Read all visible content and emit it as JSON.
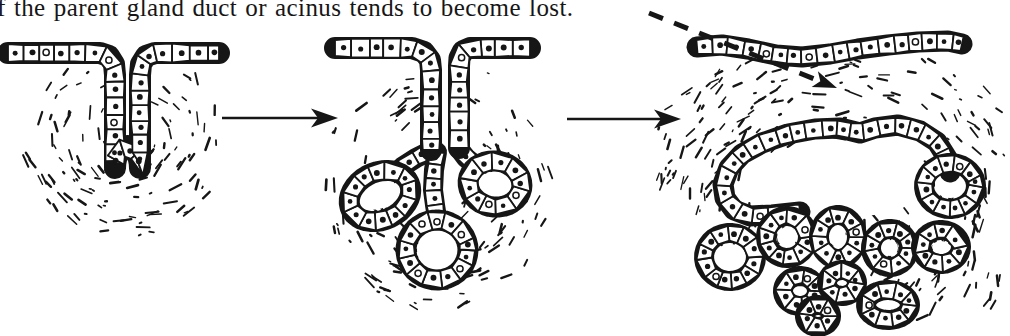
{
  "caption": {
    "text": "f the parent gland duct or acinus tends to become lost."
  },
  "figure": {
    "ink_color": "#161616",
    "paper_color": "#ffffff",
    "stages": [
      {
        "id": "simple-tubular-invagination"
      },
      {
        "id": "branching-gland-with-three-acini"
      },
      {
        "id": "detached-gland-with-acinar-cluster"
      }
    ],
    "connectors": [
      {
        "id": "arrow-stage1-to-stage2",
        "type": "solid-right-arrow"
      },
      {
        "id": "arrow-stage2-to-stage3",
        "type": "solid-right-arrow"
      },
      {
        "id": "caption-pointer",
        "type": "dashed-arrow-down-right"
      }
    ]
  }
}
